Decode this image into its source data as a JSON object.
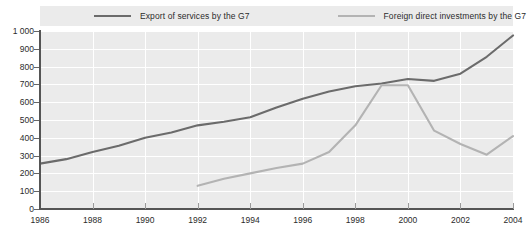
{
  "chart_data": {
    "type": "line",
    "title": "",
    "subtitle": "",
    "xlabel": "",
    "ylabel": "",
    "xlim": [
      1986,
      2004
    ],
    "ylim": [
      0,
      1000
    ],
    "grid": true,
    "legend_position": "top",
    "y_ticks": [
      "1 000",
      "900",
      "800",
      "700",
      "600",
      "500",
      "400",
      "300",
      "200",
      "100",
      "0"
    ],
    "y_tick_values": [
      1000,
      900,
      800,
      700,
      600,
      500,
      400,
      300,
      200,
      100,
      0
    ],
    "x_ticks": [
      "1986",
      "1988",
      "1990",
      "1992",
      "1994",
      "1996",
      "1998",
      "2000",
      "2002",
      "2004"
    ],
    "x_tick_values": [
      1986,
      1988,
      1990,
      1992,
      1994,
      1996,
      1998,
      2000,
      2002,
      2004
    ],
    "x": [
      1986,
      1987,
      1988,
      1989,
      1990,
      1991,
      1992,
      1993,
      1994,
      1995,
      1996,
      1997,
      1998,
      1999,
      2000,
      2001,
      2002,
      2003,
      2004
    ],
    "series": [
      {
        "name": "Export of services by the G7",
        "color": "#6b6b6b",
        "x": [
          1986,
          1987,
          1988,
          1989,
          1990,
          1991,
          1992,
          1993,
          1994,
          1995,
          1996,
          1997,
          1998,
          1999,
          2000,
          2001,
          2002,
          2003,
          2004
        ],
        "values": [
          255,
          280,
          320,
          355,
          400,
          430,
          470,
          490,
          515,
          570,
          620,
          660,
          690,
          705,
          730,
          720,
          760,
          855,
          975
        ]
      },
      {
        "name": "Foreign direct investments by the G7",
        "color": "#b3b3b3",
        "x": [
          1992,
          1993,
          1994,
          1995,
          1996,
          1997,
          1998,
          1999,
          2000,
          2001,
          2002,
          2003,
          2004
        ],
        "values": [
          130,
          170,
          200,
          230,
          255,
          320,
          470,
          695,
          695,
          440,
          365,
          305,
          410
        ]
      }
    ]
  },
  "legend": {
    "entries": [
      {
        "label": "Export of services by the G7"
      },
      {
        "label": "Foreign direct investments by the G7"
      }
    ]
  },
  "colors": {
    "panel_background": "#ebebeb",
    "gridline": "#ffffff",
    "axis": "#555555",
    "series_dark": "#6b6b6b",
    "series_light": "#b3b3b3",
    "text": "#2b2b2b"
  }
}
